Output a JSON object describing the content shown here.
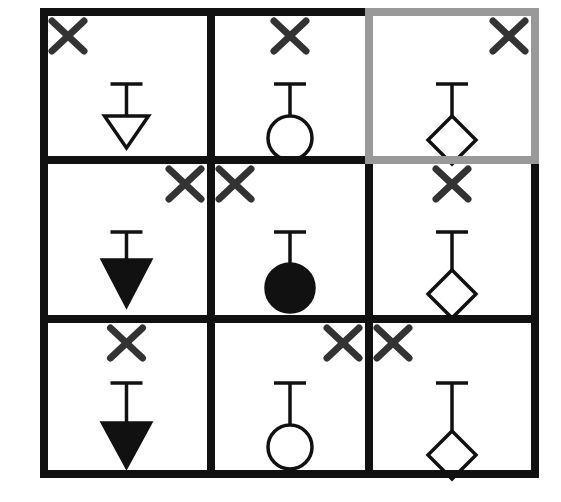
{
  "puzzle": {
    "rows": 3,
    "cols": 3,
    "line_color": "#111111",
    "highlight_color": "#999999",
    "mark_color": "#333333",
    "highlighted_cell": [
      0,
      2
    ],
    "cells": [
      {
        "row": 0,
        "col": 0,
        "shape": "triangle",
        "fill": "hollow",
        "x_mark": "top-left"
      },
      {
        "row": 0,
        "col": 1,
        "shape": "circle",
        "fill": "hollow",
        "x_mark": "top-center"
      },
      {
        "row": 0,
        "col": 2,
        "shape": "diamond",
        "fill": "hollow",
        "x_mark": "top-right"
      },
      {
        "row": 1,
        "col": 0,
        "shape": "triangle",
        "fill": "filled",
        "x_mark": "top-right"
      },
      {
        "row": 1,
        "col": 1,
        "shape": "circle",
        "fill": "filled",
        "x_mark": "top-left"
      },
      {
        "row": 1,
        "col": 2,
        "shape": "diamond",
        "fill": "hollow",
        "x_mark": "top-center"
      },
      {
        "row": 2,
        "col": 0,
        "shape": "triangle",
        "fill": "filled",
        "x_mark": "top-center"
      },
      {
        "row": 2,
        "col": 1,
        "shape": "circle",
        "fill": "hollow",
        "x_mark": "top-right"
      },
      {
        "row": 2,
        "col": 2,
        "shape": "diamond",
        "fill": "hollow",
        "x_mark": "top-left"
      }
    ]
  }
}
